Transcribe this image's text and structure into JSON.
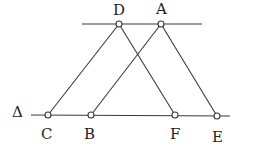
{
  "diagram": {
    "title": "",
    "line_label": "Δ",
    "color": "#3a3a3a",
    "lines": {
      "top": {
        "x1": 82,
        "y1": 24,
        "x2": 202,
        "y2": 24
      },
      "bottom": {
        "x1": 31,
        "y1": 115,
        "x2": 230,
        "y2": 116
      }
    },
    "points": {
      "D": {
        "label": "D",
        "x": 119,
        "y": 24
      },
      "A": {
        "label": "A",
        "x": 161,
        "y": 24
      },
      "C": {
        "label": "C",
        "x": 48,
        "y": 115
      },
      "B": {
        "label": "B",
        "x": 91,
        "y": 115
      },
      "F": {
        "label": "F",
        "x": 175,
        "y": 115
      },
      "E": {
        "label": "E",
        "x": 217,
        "y": 116
      }
    },
    "segments": [
      [
        "D",
        "C"
      ],
      [
        "D",
        "F"
      ],
      [
        "A",
        "B"
      ],
      [
        "A",
        "E"
      ]
    ]
  }
}
